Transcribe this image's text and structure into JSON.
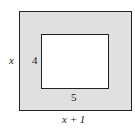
{
  "diagram": {
    "outer_rect": {
      "width_label": "x + 1",
      "height_label": "x",
      "fill": "#e0e0e0"
    },
    "inner_rect": {
      "width_label": "5",
      "height_label": "4",
      "fill": "#ffffff"
    }
  }
}
